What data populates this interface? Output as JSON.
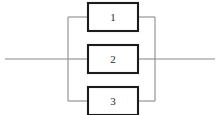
{
  "diagram": {
    "type": "parallel-block-diagram",
    "title": "",
    "blocks": [
      {
        "id": "block-1",
        "label": "1",
        "x": 88,
        "y": 3,
        "width": 50,
        "height": 28
      },
      {
        "id": "block-2",
        "label": "2",
        "x": 88,
        "y": 45,
        "width": 50,
        "height": 28
      },
      {
        "id": "block-3",
        "label": "3",
        "x": 88,
        "y": 87,
        "width": 50,
        "height": 28
      }
    ],
    "buses": {
      "left_x": 68,
      "right_x": 155,
      "top_y": 17,
      "bottom_y": 101,
      "mid_y": 59
    },
    "leads": {
      "input_start_x": 5,
      "output_end_x": 215
    },
    "colors": {
      "wire": "#8a8a8a",
      "block_border": "#1c1c1c",
      "block_fill": "#ffffff",
      "label_text": "#2a2a2a",
      "background": "#ffffff"
    }
  }
}
